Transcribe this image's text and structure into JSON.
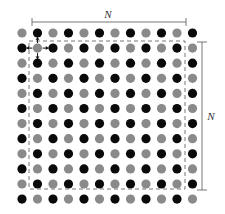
{
  "diagram": {
    "grid": {
      "rows": 12,
      "cols": 12,
      "origin_x": 22,
      "origin_y": 33,
      "spacing_x": 15.5,
      "spacing_y": 15.1,
      "dot_radius": 4.6,
      "pattern": "checkerboard: (row+col) even = gray, odd = black"
    },
    "colors": {
      "sublattice_a": "#8a8a8a",
      "sublattice_b": "#0a0a0a",
      "line": "#777777",
      "dash": "#777777",
      "arrow": "#111111",
      "background": "#ffffff"
    },
    "dashed_box": {
      "x": 29,
      "y": 41,
      "width": 156,
      "height": 148
    },
    "highlight_site": {
      "row": 1,
      "col": 1,
      "neighbors": [
        "left",
        "right",
        "up",
        "down"
      ]
    },
    "dimension_top": {
      "label": "N",
      "x1": 32,
      "x2": 186,
      "y": 22
    },
    "dimension_right": {
      "label": "N",
      "y1": 42,
      "y2": 190,
      "x": 202
    }
  }
}
